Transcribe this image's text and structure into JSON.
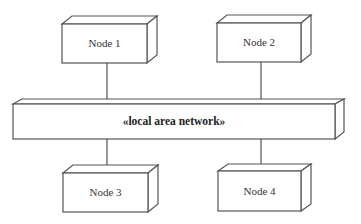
{
  "diagram": {
    "type": "UML deployment diagram",
    "network": {
      "label": "«local area network»"
    },
    "nodes": [
      {
        "id": "node1",
        "label": "Node 1",
        "position": "top-left"
      },
      {
        "id": "node2",
        "label": "Node 2",
        "position": "top-right"
      },
      {
        "id": "node3",
        "label": "Node 3",
        "position": "bottom-left"
      },
      {
        "id": "node4",
        "label": "Node 4",
        "position": "bottom-right"
      }
    ],
    "connections": [
      {
        "from": "node1",
        "to": "network"
      },
      {
        "from": "node2",
        "to": "network"
      },
      {
        "from": "node3",
        "to": "network"
      },
      {
        "from": "node4",
        "to": "network"
      }
    ],
    "colors": {
      "stroke": "#555555",
      "fill": "#ffffff",
      "text": "#333333"
    }
  }
}
